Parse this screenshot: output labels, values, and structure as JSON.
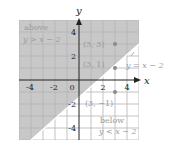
{
  "diagram": {
    "axes": {
      "x_label": "x",
      "y_label": "y",
      "x_ticks": [
        "-4",
        "-2",
        "0",
        "2",
        "4"
      ],
      "y_ticks": [
        "4",
        "2",
        "-2",
        "-4"
      ],
      "range": [
        -5,
        5
      ]
    },
    "line": {
      "label": "y = x − 2",
      "equation": "y = x - 2",
      "color": "#ffffff"
    },
    "regions": {
      "above": {
        "title": "above",
        "inequality": "y > x − 2",
        "fill": "#c8c8c8"
      },
      "below": {
        "title": "below",
        "inequality": "y < x − 2",
        "fill": "#ffffff"
      }
    },
    "points": [
      {
        "label": "(3, 3)",
        "x": 3,
        "y": 3
      },
      {
        "label": "(3, 1)",
        "x": 3,
        "y": 1
      },
      {
        "label": "(3, −1)",
        "x": 3,
        "y": -1
      }
    ],
    "colors": {
      "grid": "#b4b4b4",
      "axis": "#222222",
      "point": "#8a8a8a",
      "text_light": "#9a9a9a"
    }
  }
}
